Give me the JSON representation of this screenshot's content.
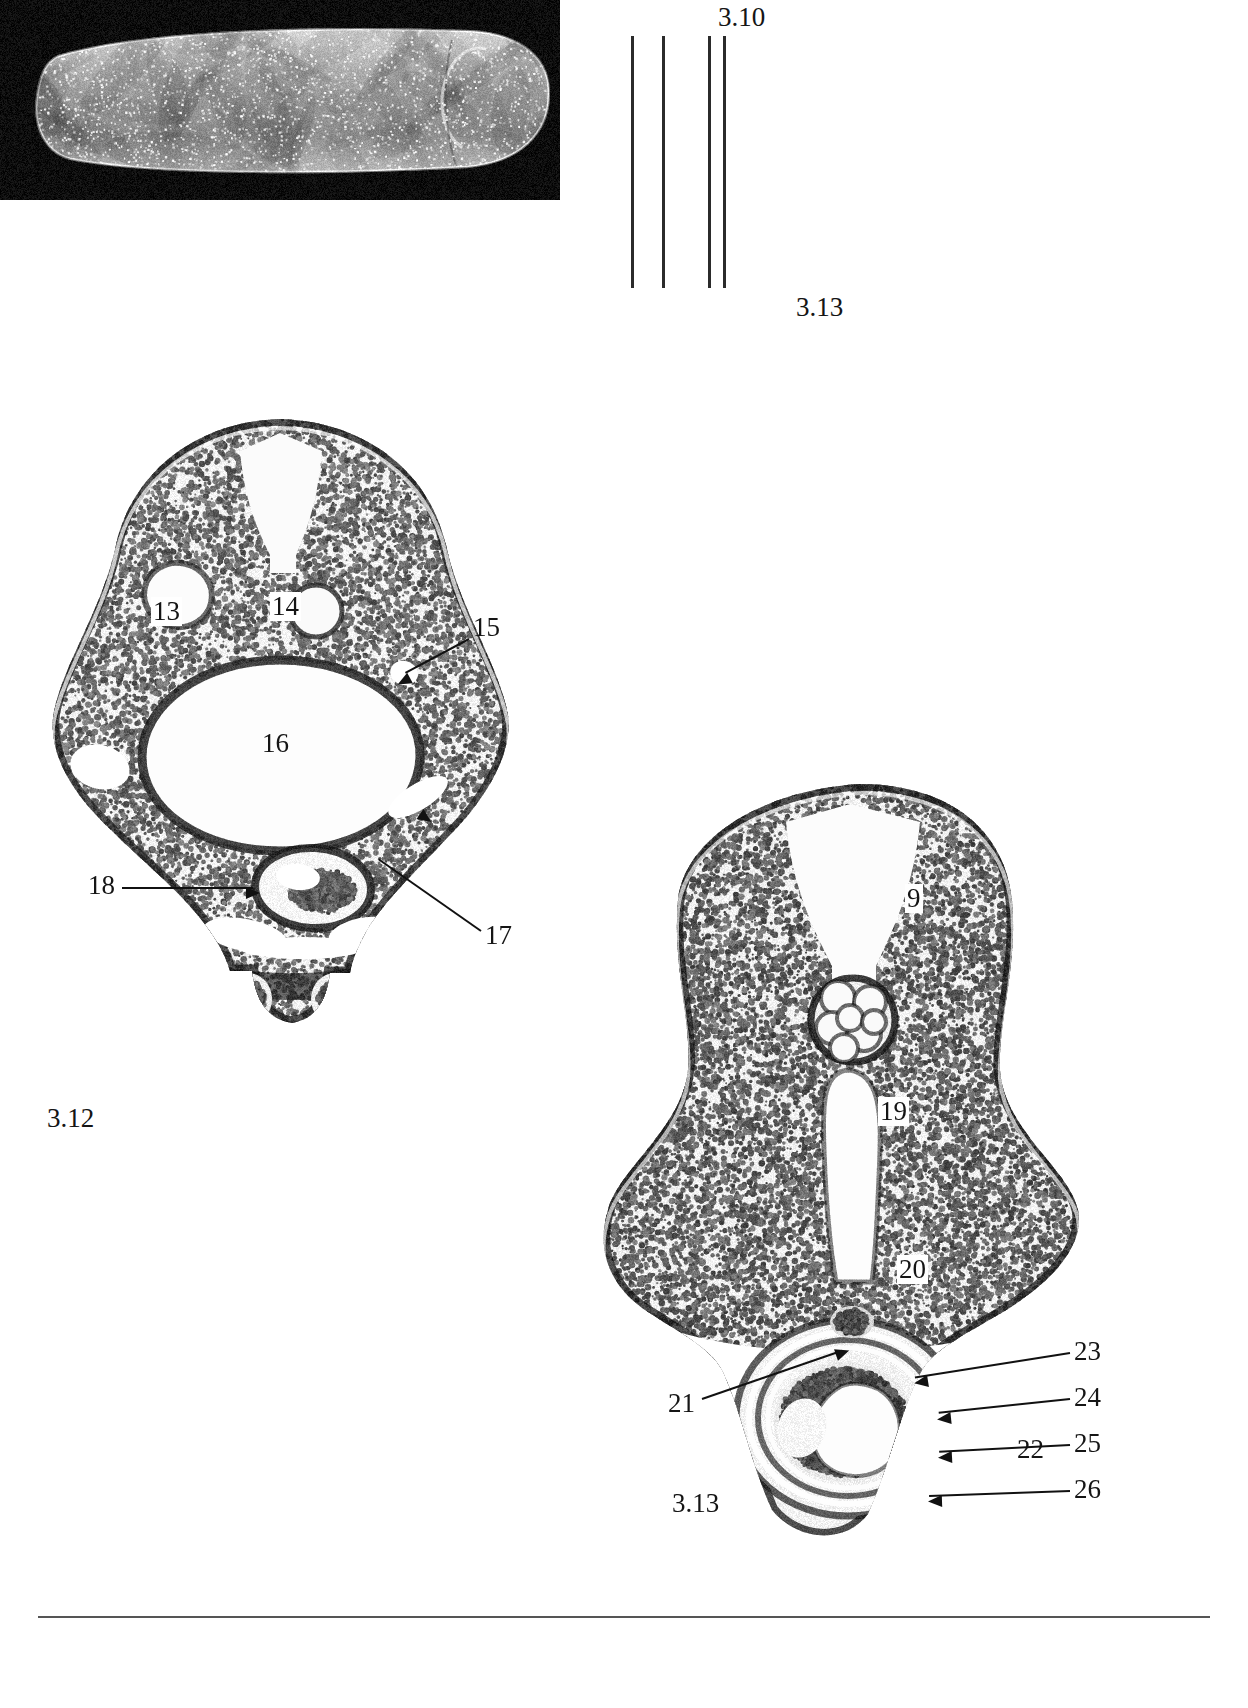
{
  "figure": {
    "panels": [
      {
        "id": "sem",
        "type": "sem-whole-mount",
        "caption_top": "3.10",
        "caption_bottom": "3.13",
        "section_line_count": 4
      },
      {
        "id": "section-312",
        "type": "histological-cross-section",
        "caption": "3.12",
        "labels": [
          "13",
          "14",
          "15",
          "16",
          "17",
          "18"
        ]
      },
      {
        "id": "section-313",
        "type": "histological-cross-section",
        "caption": "3.13",
        "labels": [
          "9",
          "19",
          "20",
          "21",
          "22",
          "23",
          "24",
          "25",
          "26"
        ]
      }
    ]
  },
  "sem": {
    "label_310": "3.10",
    "label_313": "3.13"
  },
  "panel312": {
    "caption": "3.12",
    "l13": "13",
    "l14": "14",
    "l15": "15",
    "l16": "16",
    "l17": "17",
    "l18": "18"
  },
  "panel313": {
    "caption": "3.13",
    "l9": "9",
    "l19": "19",
    "l20": "20",
    "l21": "21",
    "l22": "22",
    "l23": "23",
    "l24": "24",
    "l25": "25",
    "l26": "26"
  },
  "colors": {
    "ink": "#151515",
    "leader": "#111111",
    "sem_background": "#111111",
    "page": "#ffffff",
    "rule": "#555555"
  }
}
